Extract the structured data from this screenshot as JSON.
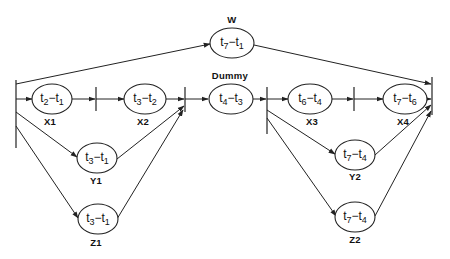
{
  "diagram": {
    "type": "activity-network",
    "nodes": [
      {
        "id": "W",
        "name": "W",
        "expr": {
          "a": "7",
          "b": "1"
        }
      },
      {
        "id": "X1",
        "name": "X1",
        "expr": {
          "a": "2",
          "b": "1"
        }
      },
      {
        "id": "X2",
        "name": "X2",
        "expr": {
          "a": "3",
          "b": "2"
        }
      },
      {
        "id": "Dummy",
        "name": "Dummy",
        "expr": {
          "a": "4",
          "b": "3"
        }
      },
      {
        "id": "X3",
        "name": "X3",
        "expr": {
          "a": "6",
          "b": "4"
        }
      },
      {
        "id": "X4",
        "name": "X4",
        "expr": {
          "a": "7",
          "b": "6"
        }
      },
      {
        "id": "Y1",
        "name": "Y1",
        "expr": {
          "a": "3",
          "b": "1"
        }
      },
      {
        "id": "Z1",
        "name": "Z1",
        "expr": {
          "a": "3",
          "b": "1"
        }
      },
      {
        "id": "Y2",
        "name": "Y2",
        "expr": {
          "a": "7",
          "b": "4"
        }
      },
      {
        "id": "Z2",
        "name": "Z2",
        "expr": {
          "a": "7",
          "b": "4"
        }
      }
    ],
    "edges": [
      [
        "start",
        "W"
      ],
      [
        "W",
        "end"
      ],
      [
        "start",
        "X1"
      ],
      [
        "X1",
        "X2"
      ],
      [
        "X2",
        "merge1"
      ],
      [
        "start",
        "Y1"
      ],
      [
        "Y1",
        "merge1"
      ],
      [
        "start",
        "Z1"
      ],
      [
        "Z1",
        "merge1"
      ],
      [
        "merge1",
        "Dummy"
      ],
      [
        "Dummy",
        "split2"
      ],
      [
        "split2",
        "X3"
      ],
      [
        "X3",
        "X4"
      ],
      [
        "X4",
        "end"
      ],
      [
        "split2",
        "Y2"
      ],
      [
        "Y2",
        "end"
      ],
      [
        "split2",
        "Z2"
      ],
      [
        "Z2",
        "end"
      ]
    ],
    "t": "t",
    "minus": "−"
  }
}
